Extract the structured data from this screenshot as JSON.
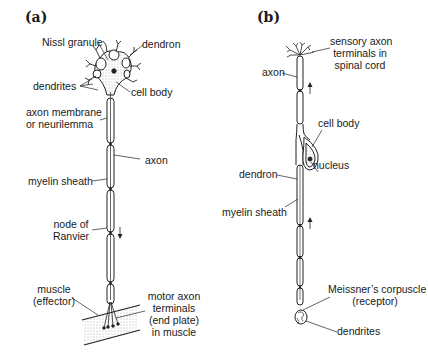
{
  "panels": {
    "a": {
      "label": "(a)",
      "labels": {
        "nissl": "Nissl granule",
        "dendron": "dendron",
        "dendrites": "dendrites",
        "cell_body": "cell body",
        "axon_membrane_1": "axon membrane",
        "axon_membrane_2": "or neurilemma",
        "axon": "axon",
        "myelin": "myelin sheath",
        "node_1": "node of",
        "node_2": "Ranvier",
        "muscle_1": "muscle",
        "muscle_2": "(effector)",
        "motor_1": "motor axon",
        "motor_2": "terminals",
        "motor_3": "(end plate)",
        "motor_4": "in muscle"
      },
      "impulse_direction": "down"
    },
    "b": {
      "label": "(b)",
      "labels": {
        "sensory_1": "sensory axon",
        "sensory_2": "terminals in",
        "sensory_3": "spinal cord",
        "axon": "axon",
        "cell_body": "cell body",
        "nucleus": "nucleus",
        "dendron": "dendron",
        "myelin": "myelin sheath",
        "meissner_1": "Meissner’s corpuscle",
        "meissner_2": "(receptor)",
        "dendrites": "dendrites"
      },
      "impulse_direction": "up"
    }
  }
}
